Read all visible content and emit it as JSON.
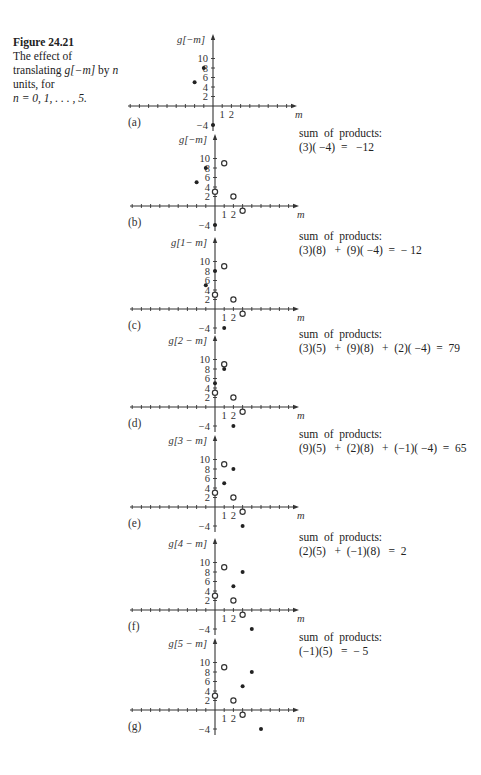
{
  "caption": {
    "figure_label": "Figure 24.21",
    "line1": "The effect of",
    "line2_prefix": "translating ",
    "line2_math": "g[−m]",
    "line2_suffix": " by ",
    "line2_n": "n",
    "line3": "units, for",
    "line4": "n = 0, 1, . . . , 5."
  },
  "axis": {
    "x_label": "m",
    "x_ticks": [
      "1",
      "2"
    ],
    "y_ticks": [
      "10",
      "8",
      "6",
      "4",
      "2",
      "−4"
    ]
  },
  "panels": [
    {
      "label": "(a)",
      "ylabel": "g[−m]",
      "shift": 0,
      "sum_title": "",
      "sum_expr": ""
    },
    {
      "label": "(b)",
      "ylabel": "g[−m]",
      "shift": 0,
      "sum_title": "sum  of  products:",
      "sum_expr": "(3)( −4)  =   −12"
    },
    {
      "label": "(c)",
      "ylabel": "g[1− m]",
      "shift": 1,
      "sum_title": "sum  of  products:",
      "sum_expr": "(3)(8)   +  (9)( −4)  =  − 12"
    },
    {
      "label": "(d)",
      "ylabel": "g[2 − m]",
      "shift": 2,
      "sum_title": "sum  of  products:",
      "sum_expr": "(3)(5)   +  (9)(8)   +  (2)( −4)  =  79"
    },
    {
      "label": "(e)",
      "ylabel": "g[3 − m]",
      "shift": 3,
      "sum_title": "sum  of  products:",
      "sum_expr": "(9)(5)   +  (2)(8)   +  (−1)( −4)  =  65"
    },
    {
      "label": "(f)",
      "ylabel": "g[4 − m]",
      "shift": 4,
      "sum_title": "sum  of  products:",
      "sum_expr": "(2)(5)   +  (−1)(8)   =  2"
    },
    {
      "label": "(g)",
      "ylabel": "g[5 − m]",
      "shift": 5,
      "sum_title": "sum  of  products:",
      "sum_expr": "(−1)(5)   =  − 5"
    }
  ],
  "chart_data": [
    {
      "type": "scatter",
      "title": "(a) g[−m]",
      "xlabel": "m",
      "ylabel": "g[−m]",
      "series": [
        {
          "name": "g[−m] (filled)",
          "points": [
            [
              -2,
              5
            ],
            [
              -1,
              8
            ],
            [
              0,
              -4
            ]
          ]
        }
      ]
    },
    {
      "type": "scatter",
      "title": "(b) g[−m] with f[m]",
      "xlabel": "m",
      "ylabel": "g[−m]",
      "series": [
        {
          "name": "g[−m] (filled)",
          "points": [
            [
              -2,
              5
            ],
            [
              -1,
              8
            ],
            [
              0,
              -4
            ]
          ]
        },
        {
          "name": "f[m] (open)",
          "points": [
            [
              0,
              3
            ],
            [
              1,
              9
            ],
            [
              2,
              2
            ],
            [
              3,
              -1
            ]
          ]
        }
      ]
    },
    {
      "type": "scatter",
      "title": "(c) g[1−m]",
      "xlabel": "m",
      "ylabel": "g[1−m]",
      "series": [
        {
          "name": "g[1−m] (filled)",
          "points": [
            [
              -1,
              5
            ],
            [
              0,
              8
            ],
            [
              1,
              -4
            ]
          ]
        },
        {
          "name": "f[m] (open)",
          "points": [
            [
              0,
              3
            ],
            [
              1,
              9
            ],
            [
              2,
              2
            ],
            [
              3,
              -1
            ]
          ]
        }
      ]
    },
    {
      "type": "scatter",
      "title": "(d) g[2−m]",
      "xlabel": "m",
      "ylabel": "g[2−m]",
      "series": [
        {
          "name": "g[2−m] (filled)",
          "points": [
            [
              0,
              5
            ],
            [
              1,
              8
            ],
            [
              2,
              -4
            ]
          ]
        },
        {
          "name": "f[m] (open)",
          "points": [
            [
              0,
              3
            ],
            [
              1,
              9
            ],
            [
              2,
              2
            ],
            [
              3,
              -1
            ]
          ]
        }
      ]
    },
    {
      "type": "scatter",
      "title": "(e) g[3−m]",
      "xlabel": "m",
      "ylabel": "g[3−m]",
      "series": [
        {
          "name": "g[3−m] (filled)",
          "points": [
            [
              1,
              5
            ],
            [
              2,
              8
            ],
            [
              3,
              -4
            ]
          ]
        },
        {
          "name": "f[m] (open)",
          "points": [
            [
              0,
              3
            ],
            [
              1,
              9
            ],
            [
              2,
              2
            ],
            [
              3,
              -1
            ]
          ]
        }
      ]
    },
    {
      "type": "scatter",
      "title": "(f) g[4−m]",
      "xlabel": "m",
      "ylabel": "g[4−m]",
      "series": [
        {
          "name": "g[4−m] (filled)",
          "points": [
            [
              2,
              5
            ],
            [
              3,
              8
            ],
            [
              4,
              -4
            ]
          ]
        },
        {
          "name": "f[m] (open)",
          "points": [
            [
              0,
              3
            ],
            [
              1,
              9
            ],
            [
              2,
              2
            ],
            [
              3,
              -1
            ]
          ]
        }
      ]
    },
    {
      "type": "scatter",
      "title": "(g) g[5−m]",
      "xlabel": "m",
      "ylabel": "g[5−m]",
      "series": [
        {
          "name": "g[5−m] (filled)",
          "points": [
            [
              3,
              5
            ],
            [
              4,
              8
            ],
            [
              5,
              -4
            ]
          ]
        },
        {
          "name": "f[m] (open)",
          "points": [
            [
              0,
              3
            ],
            [
              1,
              9
            ],
            [
              2,
              2
            ],
            [
              3,
              -1
            ]
          ]
        }
      ]
    }
  ],
  "sums": [
    null,
    -12,
    -12,
    79,
    65,
    2,
    -5
  ]
}
